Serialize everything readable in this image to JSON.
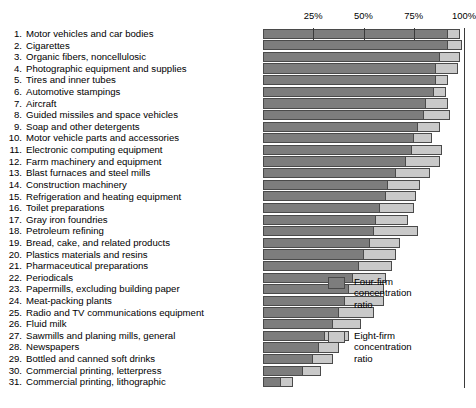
{
  "chart_data": {
    "type": "bar",
    "orientation": "horizontal",
    "title": "",
    "subtitle": "",
    "xlabel": "",
    "ylabel": "",
    "xlim": [
      0,
      100
    ],
    "xticks": [
      25,
      50,
      75,
      100
    ],
    "xtick_labels": [
      "25%",
      "50%",
      "75%",
      "100%"
    ],
    "grid": true,
    "legend_position": "right",
    "categories": [
      "Motor vehicles and car bodies",
      "Cigarettes",
      "Organic fibers, noncellulosic",
      "Photographic equipment and supplies",
      "Tires and inner tubes",
      "Automotive stampings",
      "Aircraft",
      "Guided missiles and space vehicles",
      "Soap and other detergents",
      "Motor vehicle parts and accessories",
      "Electronic computing equipment",
      "Farm machinery and equipment",
      "Blast furnaces and steel mills",
      "Construction machinery",
      "Refrigeration and heating equipment",
      "Toilet preparations",
      "Gray iron foundries",
      "Petroleum refining",
      "Bread, cake, and related products",
      "Plastics materials and resins",
      "Pharmaceutical preparations",
      "Periodicals",
      "Papermills, excluding building paper",
      "Meat-packing plants",
      "Radio and TV communications equipment",
      "Fluid milk",
      "Sawmills and planing mills, general",
      "Newspapers",
      "Bottled and canned soft drinks",
      "Commercial printing, letterpress",
      "Commercial printing, lithographic"
    ],
    "series": [
      {
        "name": "Four-firm concentration ratio",
        "color": "#7d7d7d",
        "values": [
          92,
          92,
          88,
          86,
          86,
          85,
          81,
          80,
          77,
          75,
          74,
          71,
          66,
          62,
          61,
          58,
          56,
          55,
          53,
          50,
          48,
          45,
          43,
          41,
          38,
          35,
          31,
          28,
          25,
          20,
          9
        ]
      },
      {
        "name": "Eight-firm concentration ratio",
        "color": "#c9c9c9",
        "values": [
          98,
          99,
          98,
          97,
          92,
          91,
          92,
          93,
          88,
          84,
          89,
          88,
          83,
          78,
          76,
          75,
          72,
          77,
          68,
          66,
          64,
          61,
          60,
          60,
          55,
          49,
          43,
          38,
          35,
          29,
          15
        ]
      }
    ],
    "legend": [
      {
        "label": "Four-firm\nconcentration\nratio",
        "swatch": "four"
      },
      {
        "label": "Eight-firm\nconcentration\nratio",
        "swatch": "eight"
      }
    ]
  }
}
